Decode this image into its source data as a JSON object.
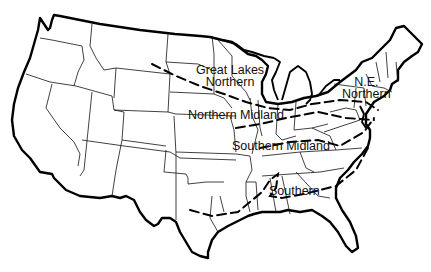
{
  "map": {
    "subject": "United States dialect regions",
    "regions": [
      {
        "id": "great-lakes-northern",
        "line1": "Great Lakes",
        "line2": "Northern"
      },
      {
        "id": "ne-northern",
        "line1": "N.E.",
        "line2": "Northern"
      },
      {
        "id": "northern-midland",
        "line1": "Northern Midland"
      },
      {
        "id": "southern-midland",
        "line1": "Southern Midland"
      },
      {
        "id": "southern",
        "line1": "Southern"
      }
    ],
    "colors": {
      "ink": "#000000",
      "background": "#ffffff"
    }
  }
}
